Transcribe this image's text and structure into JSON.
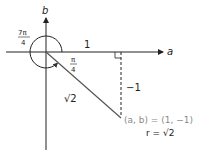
{
  "diagram": {
    "axes": {
      "x_label": "a",
      "y_label": "b"
    },
    "angles": {
      "large_angle_num": "7π",
      "large_angle_den": "4",
      "small_angle_num": "π",
      "small_angle_den": "4"
    },
    "segments": {
      "horizontal_length": "1",
      "vertical_length": "−1",
      "hypotenuse_length": "√2"
    },
    "point": {
      "coords_label": "(a, b) = (1, −1)",
      "radius_label": "r = √2"
    },
    "colors": {
      "lines": "#222222",
      "hypotenuse": "#555555",
      "point_label": "#8a8a8a"
    }
  }
}
